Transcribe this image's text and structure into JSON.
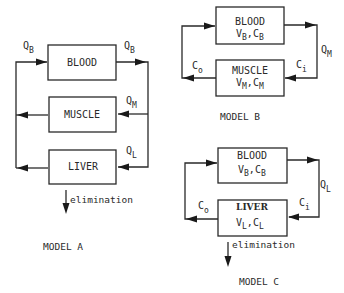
{
  "models": {
    "a": {
      "title": "MODEL A",
      "compartments": {
        "blood": "BLOOD",
        "muscle": "MUSCLE",
        "liver": "LIVER"
      },
      "flows": {
        "blood_in": "Q",
        "blood_in_sub": "B",
        "blood_out": "Q",
        "blood_out_sub": "B",
        "muscle": "Q",
        "muscle_sub": "M",
        "liver": "Q",
        "liver_sub": "L"
      },
      "elimination": "elimination"
    },
    "b": {
      "title": "MODEL B",
      "compartments": {
        "blood": "BLOOD",
        "blood_vars": {
          "v": "V",
          "v_sub": "B",
          "c": "C",
          "c_sub": "B"
        },
        "muscle": "MUSCLE",
        "muscle_vars": {
          "v": "V",
          "v_sub": "M",
          "c": "C",
          "c_sub": "M"
        }
      },
      "flows": {
        "q": "Q",
        "q_sub": "M",
        "c_in": "C",
        "c_in_sub": "i",
        "c_out": "C",
        "c_out_sub": "o"
      }
    },
    "c": {
      "title": "MODEL C",
      "compartments": {
        "blood": "BLOOD",
        "blood_vars": {
          "v": "V",
          "v_sub": "B",
          "c": "C",
          "c_sub": "B"
        },
        "liver": "LIVER",
        "liver_vars": {
          "v": "V",
          "v_sub": "L",
          "c": "C",
          "c_sub": "L"
        }
      },
      "flows": {
        "q": "Q",
        "q_sub": "L",
        "c_in": "C",
        "c_in_sub": "i",
        "c_out": "C",
        "c_out_sub": "o"
      },
      "elimination": "elimination"
    }
  },
  "colors": {
    "ink": "#2a2a2a",
    "background": "#ffffff"
  }
}
